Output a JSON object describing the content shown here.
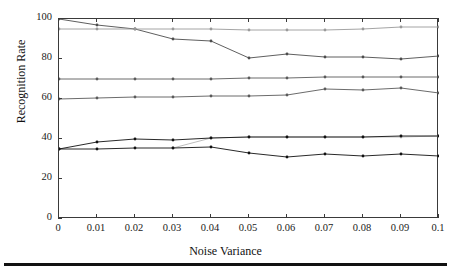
{
  "chart_data": {
    "type": "line",
    "title": "",
    "xlabel": "Noise Variance",
    "ylabel": "Recognition Rate",
    "xlim": [
      0,
      0.1
    ],
    "ylim": [
      0,
      100
    ],
    "grid": false,
    "legend": "none",
    "x": [
      0,
      0.01,
      0.02,
      0.03,
      0.04,
      0.05,
      0.06,
      0.07,
      0.08,
      0.09,
      0.1
    ],
    "xticklabels": [
      "0",
      "0.01",
      "0.02",
      "0.03",
      "0.04",
      "0.05",
      "0.06",
      "0.07",
      "0.08",
      "0.09",
      "0.1"
    ],
    "yticks": [
      0,
      20,
      40,
      60,
      80,
      100
    ],
    "yticklabels": [
      "0",
      "20",
      "40",
      "60",
      "80",
      "100"
    ],
    "series": [
      {
        "name": "series-1-descending-high",
        "color": "#4d4d4d",
        "marker": "dot",
        "x": [
          0,
          0.01,
          0.02,
          0.03,
          0.04,
          0.05,
          0.06,
          0.07,
          0.08,
          0.09,
          0.1
        ],
        "values": [
          100,
          97.0,
          95.0,
          90.0,
          89.0,
          80.5,
          82.5,
          81.0,
          81.0,
          80.0,
          81.5
        ]
      },
      {
        "name": "series-2-flat-95",
        "color": "#9a9a9a",
        "marker": "dot",
        "x": [
          0,
          0.01,
          0.02,
          0.03,
          0.04,
          0.05,
          0.06,
          0.07,
          0.08,
          0.09,
          0.1
        ],
        "values": [
          95.0,
          95.0,
          95.0,
          95.0,
          95.0,
          94.5,
          94.5,
          94.5,
          95.0,
          96.0,
          96.0
        ]
      },
      {
        "name": "series-3-flat-70",
        "color": "#5a5a5a",
        "marker": "dot",
        "x": [
          0,
          0.01,
          0.02,
          0.03,
          0.04,
          0.05,
          0.06,
          0.07,
          0.08,
          0.09,
          0.1
        ],
        "values": [
          70.0,
          70.0,
          70.0,
          70.0,
          70.0,
          70.5,
          70.5,
          71.0,
          71.0,
          71.0,
          71.0
        ]
      },
      {
        "name": "series-4-rising-60",
        "color": "#5a5a5a",
        "marker": "dot",
        "x": [
          0,
          0.01,
          0.02,
          0.03,
          0.04,
          0.05,
          0.06,
          0.07,
          0.08,
          0.09,
          0.1
        ],
        "values": [
          60.0,
          60.5,
          61.0,
          61.0,
          61.5,
          61.5,
          62.0,
          65.0,
          64.5,
          65.5,
          63.0
        ]
      },
      {
        "name": "series-5-light-41",
        "color": "#b5b5b5",
        "marker": "dot",
        "x": [
          0.03,
          0.04,
          0.05,
          0.06,
          0.07,
          0.08,
          0.09,
          0.1
        ],
        "values": [
          35.5,
          40.5,
          41.0,
          41.0,
          41.0,
          41.0,
          41.0,
          41.5
        ]
      },
      {
        "name": "series-6-dark-rising-40",
        "color": "#111111",
        "marker": "dot",
        "x": [
          0,
          0.01,
          0.02,
          0.03,
          0.04,
          0.05,
          0.06,
          0.07,
          0.08,
          0.09,
          0.1
        ],
        "values": [
          35.0,
          38.5,
          40.0,
          39.5,
          40.5,
          41.0,
          41.0,
          41.0,
          41.0,
          41.5,
          41.5
        ]
      },
      {
        "name": "series-7-dark-dropping-31",
        "color": "#111111",
        "marker": "dot",
        "x": [
          0,
          0.01,
          0.02,
          0.03,
          0.04,
          0.05,
          0.06,
          0.07,
          0.08,
          0.09,
          0.1
        ],
        "values": [
          35.0,
          35.0,
          35.5,
          35.5,
          36.0,
          33.0,
          31.0,
          32.5,
          31.5,
          32.5,
          31.5
        ]
      }
    ]
  },
  "axes": {
    "ylabel": "Recognition Rate",
    "xlabel": "Noise Variance"
  }
}
